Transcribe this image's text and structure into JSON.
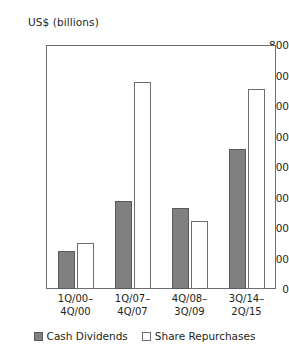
{
  "chart_data": {
    "type": "bar",
    "title": "",
    "xlabel": "",
    "ylabel": "US$ (billions)",
    "ylim": [
      0,
      800
    ],
    "yticks": [
      0,
      100,
      200,
      300,
      400,
      500,
      600,
      700,
      800
    ],
    "grid": false,
    "legend_position": "bottom",
    "categories": [
      "1Q/00–\n4Q/00",
      "1Q/07–\n4Q/07",
      "4Q/08–\n3Q/09",
      "3Q/14–\n2Q/15"
    ],
    "category_lines": [
      [
        "1Q/00–",
        "4Q/00"
      ],
      [
        "1Q/07–",
        "4Q/07"
      ],
      [
        "4Q/08–",
        "3Q/09"
      ],
      [
        "3Q/14–",
        "2Q/15"
      ]
    ],
    "series": [
      {
        "name": "Cash Dividends",
        "color": "#808080",
        "values": [
          125,
          288,
          265,
          460
        ]
      },
      {
        "name": "Share Repurchases",
        "color": "#ffffff",
        "values": [
          150,
          680,
          222,
          655
        ]
      }
    ]
  },
  "colors": {
    "dividends_fill": "#808080",
    "repurchases_fill": "#ffffff",
    "axis": "#6d6e71",
    "text": "#231f20"
  }
}
